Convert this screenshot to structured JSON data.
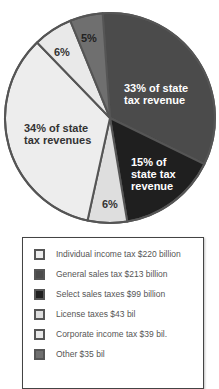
{
  "chart_data": {
    "type": "pie",
    "title": "",
    "center": [
      110,
      118
    ],
    "radius": 105,
    "start_angle_deg": -4,
    "slices": [
      {
        "name": "General sales tax $213 billion",
        "short": "General sales tax",
        "value_billion": 213,
        "percent": 33,
        "label": "33% of state\ntax revenue",
        "color": "#4b4b4b",
        "label_color": "#ffffff",
        "label_pos": [
          124,
          82
        ]
      },
      {
        "name": "Select sales taxes $99 billion",
        "short": "Select sales taxes",
        "value_billion": 99,
        "percent": 15,
        "label": "15% of\nstate tax\nrevenue",
        "color": "#1f1f1f",
        "label_color": "#ffffff",
        "label_pos": [
          131,
          156
        ]
      },
      {
        "name": "License taxes $43 bil",
        "short": "License taxes",
        "value_billion": 43,
        "percent": 6,
        "label": "6%",
        "color": "#dedede",
        "label_color": "#333333",
        "label_pos": [
          102,
          198
        ]
      },
      {
        "name": "Individual income tax $220 billion",
        "short": "Individual income tax",
        "value_billion": 220,
        "percent": 34,
        "label": "34% of state\ntax revenues",
        "color": "#ededed",
        "label_color": "#333333",
        "label_pos": [
          24,
          122
        ]
      },
      {
        "name": "Corporate income tax $39 bil.",
        "short": "Corporate income tax",
        "value_billion": 39,
        "percent": 6,
        "label": "6%",
        "color": "#e9e9e9",
        "label_color": "#333333",
        "label_pos": [
          54,
          46
        ]
      },
      {
        "name": "Other $35 bil",
        "short": "Other",
        "value_billion": 35,
        "percent": 5,
        "label": "5%",
        "color": "#6f6f6f",
        "label_color": "#222222",
        "label_pos": [
          81,
          32
        ]
      }
    ],
    "legend": {
      "position": "below",
      "entries": [
        {
          "label": "Individual income tax $220 billion",
          "color": "#ededed"
        },
        {
          "label": "General sales tax $213 billion",
          "color": "#4b4b4b"
        },
        {
          "label": "Select sales taxes $99 billion",
          "color": "#1f1f1f"
        },
        {
          "label": "License taxes $43 bil",
          "color": "#dedede"
        },
        {
          "label": "Corporate income tax $39 bil.",
          "color": "#e9e9e9"
        },
        {
          "label": "Other $35 bil",
          "color": "#6f6f6f"
        }
      ]
    },
    "border_color": "#555555"
  }
}
